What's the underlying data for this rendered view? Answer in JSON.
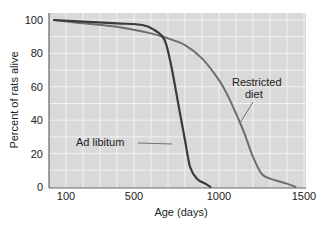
{
  "chart_data": {
    "type": "line",
    "title": "",
    "xlabel": "Age (days)",
    "ylabel": "Percent of rats alive",
    "xlim": [
      0,
      1500
    ],
    "ylim": [
      0,
      100
    ],
    "x_ticks": [
      100,
      500,
      1000,
      1500
    ],
    "y_ticks": [
      0,
      20,
      40,
      60,
      80,
      100
    ],
    "grid": true,
    "legend": "inline annotations",
    "colors": {
      "plot_bg": "#d9d9d9",
      "grid": "#f2f2f2",
      "ad_libitum": "#3a3a3a",
      "restricted": "#6e6e6e",
      "axis": "#666666"
    },
    "series": [
      {
        "name": "Ad libitum",
        "x": [
          0,
          200,
          400,
          550,
          620,
          680,
          720,
          760,
          800,
          830,
          870,
          920,
          950
        ],
        "y": [
          100,
          99,
          98,
          97,
          94,
          88,
          72,
          50,
          28,
          12,
          5,
          2,
          0
        ]
      },
      {
        "name": "Restricted diet",
        "x": [
          0,
          200,
          400,
          600,
          700,
          800,
          900,
          1000,
          1050,
          1100,
          1150,
          1200,
          1250,
          1300,
          1400,
          1450
        ],
        "y": [
          100,
          98,
          96,
          92,
          89,
          85,
          77,
          64,
          55,
          44,
          32,
          18,
          8,
          5,
          2,
          0
        ]
      }
    ],
    "annotations": [
      {
        "text": "Ad libitum",
        "points_to": "Ad libitum"
      },
      {
        "text": "Restricted\ndiet",
        "points_to": "Restricted diet"
      }
    ]
  },
  "labels": {
    "xlabel": "Age (days)",
    "ylabel": "Percent of rats alive",
    "ad_libitum": "Ad libitum",
    "restricted_line1": "Restricted",
    "restricted_line2": "diet"
  }
}
